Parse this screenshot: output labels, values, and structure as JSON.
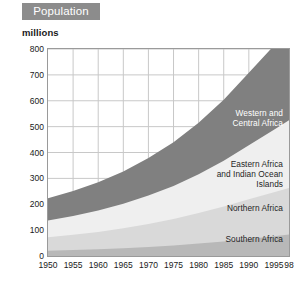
{
  "banner": {
    "title": "Population"
  },
  "axis": {
    "unit_label": "millions",
    "y_ticks": [
      "800",
      "700",
      "600",
      "500",
      "400",
      "300",
      "200",
      "100",
      "0"
    ],
    "x_ticks": [
      "1950",
      "1955",
      "1960",
      "1965",
      "1970",
      "1975",
      "1980",
      "1985",
      "1990",
      "1995",
      "98"
    ]
  },
  "series_labels": {
    "western_central": "Western and\nCentral Africa",
    "eastern": "Eastern Africa\nand Indian Ocean\nIslands",
    "northern": "Northern Africa",
    "southern": "Southern Africa"
  },
  "colors": {
    "western_central": "#808080",
    "eastern": "#efefef",
    "northern": "#d9d9d9",
    "southern": "#b8b8b8",
    "banner_bg": "#8c8c8c",
    "frame": "#9a9a9a",
    "gridline": "#c8c8c8",
    "text": "#1a1a1a"
  },
  "chart_data": {
    "type": "area",
    "title": "Population",
    "xlabel": "",
    "ylabel": "millions",
    "ylim": [
      0,
      800
    ],
    "xlim": [
      1950,
      1998
    ],
    "grid": true,
    "stacked": true,
    "legend_position": "inside-right",
    "x": [
      1950,
      1955,
      1960,
      1965,
      1970,
      1975,
      1980,
      1985,
      1990,
      1995,
      1998
    ],
    "series": [
      {
        "name": "Southern Africa",
        "color": "#b8b8b8",
        "values": [
          20,
          23,
          26,
          30,
          35,
          41,
          48,
          56,
          66,
          76,
          83
        ]
      },
      {
        "name": "Northern Africa",
        "color": "#d9d9d9",
        "values": [
          52,
          59,
          67,
          77,
          89,
          102,
          118,
          135,
          153,
          170,
          180
        ]
      },
      {
        "name": "Eastern Africa and Indian Ocean Islands",
        "color": "#efefef",
        "values": [
          65,
          73,
          83,
          95,
          110,
          128,
          150,
          177,
          209,
          242,
          262
        ]
      },
      {
        "name": "Western and Central Africa",
        "color": "#808080",
        "values": [
          86,
          96,
          109,
          125,
          145,
          169,
          199,
          236,
          280,
          325,
          353
        ]
      }
    ],
    "totals": [
      223,
      251,
      285,
      327,
      379,
      440,
      515,
      604,
      708,
      813,
      878
    ],
    "cumulative": {
      "southern": [
        20,
        23,
        26,
        30,
        35,
        41,
        48,
        56,
        66,
        76,
        83
      ],
      "northern": [
        72,
        82,
        93,
        107,
        124,
        143,
        166,
        191,
        219,
        246,
        263
      ],
      "eastern": [
        137,
        155,
        176,
        202,
        234,
        271,
        316,
        368,
        428,
        488,
        525
      ],
      "western_central": [
        223,
        251,
        285,
        327,
        379,
        440,
        515,
        604,
        708,
        813,
        878
      ]
    }
  }
}
